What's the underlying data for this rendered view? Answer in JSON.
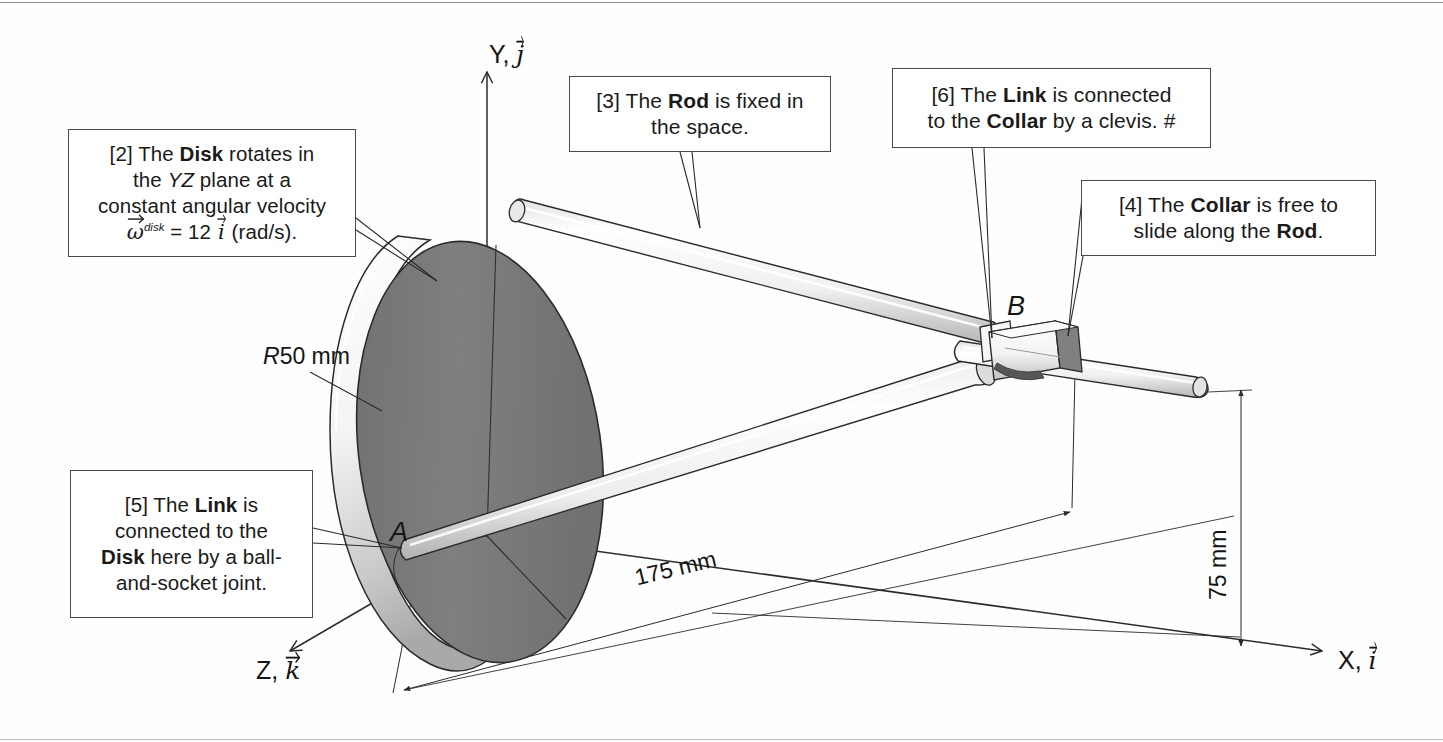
{
  "figure": {
    "type": "engineering-mechanism-diagram",
    "background_color": "#ffffff",
    "line_color": "#2b2b2b",
    "disk_face_color": "#7d7d7d",
    "disk_rim_color": "#f2f2f2",
    "rod_color": "#f5f5f5"
  },
  "callouts": [
    {
      "id": "2",
      "tag": "[2]",
      "lines": [
        "[2] The Disk rotates in",
        "the YZ plane at a",
        "constant angular velocity"
      ],
      "line1_pre": "[2] The ",
      "line1_bold": "Disk",
      "line1_post": " rotates in",
      "line2_pre": "the ",
      "line2_italic": "YZ",
      "line2_post": " plane at a",
      "line3": "constant angular velocity",
      "formula": {
        "omega": "ω",
        "superscript": "disk",
        "equals": "=",
        "magnitude": "12",
        "unit_vector": "i",
        "units": "(rad/s)",
        "period": "."
      }
    },
    {
      "id": "3",
      "tag": "[3]",
      "line1_pre": "[3] The ",
      "line1_bold": "Rod",
      "line1_post": " is fixed in",
      "line2": "the space."
    },
    {
      "id": "6",
      "tag": "[6]",
      "line1_pre": "[6] The ",
      "line1_bold": "Link",
      "line1_post": " is connected",
      "line2_pre": "to the ",
      "line2_bold": "Collar",
      "line2_post": " by a clevis. #"
    },
    {
      "id": "4",
      "tag": "[4]",
      "line1_pre": "[4] The ",
      "line1_bold": "Collar",
      "line1_post": " is free to",
      "line2_pre": "slide along the ",
      "line2_bold": "Rod",
      "line2_post": "."
    },
    {
      "id": "5",
      "tag": "[5]",
      "line1_pre": "[5] The ",
      "line1_bold": "Link",
      "line1_post": " is",
      "line2": "connected to the",
      "line3_bold": "Disk",
      "line3_post": " here by a ball-",
      "line4": "and-socket joint."
    }
  ],
  "axes": [
    {
      "name": "Y",
      "label_letter": "Y",
      "vector": "j",
      "text": "Y, j"
    },
    {
      "name": "Z",
      "label_letter": "Z",
      "vector": "k",
      "text": "Z, k"
    },
    {
      "name": "X",
      "label_letter": "X",
      "vector": "i",
      "text": "X, i"
    }
  ],
  "points": [
    {
      "id": "A",
      "label": "A",
      "note": "ball-and-socket joint on disk rim"
    },
    {
      "id": "B",
      "label": "B",
      "note": "clevis joint at collar on rod"
    }
  ],
  "dimensions": [
    {
      "id": "radius",
      "label": "R50 mm",
      "prefix_italic": "R",
      "value": "50",
      "unit": "mm"
    },
    {
      "id": "length-x",
      "label": "175 mm",
      "value": "175",
      "unit": "mm"
    },
    {
      "id": "height-y",
      "label": "75 mm",
      "value": "75",
      "unit": "mm"
    }
  ]
}
